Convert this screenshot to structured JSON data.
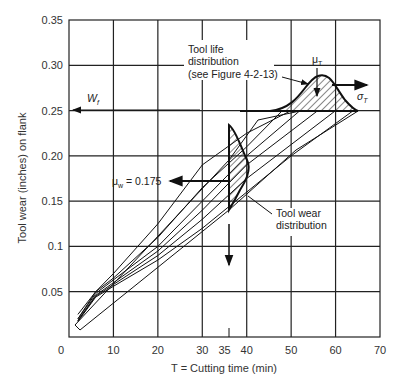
{
  "chart_data": {
    "type": "line",
    "title": "",
    "xlabel": "T = Cutting time (min)",
    "ylabel": "Tool wear (inches) on flank",
    "xlim": [
      0,
      70
    ],
    "ylim": [
      0,
      0.35
    ],
    "x_ticks": [
      "0",
      "10",
      "20",
      "30",
      "35",
      "40",
      "50",
      "60",
      "70"
    ],
    "x_tick_values": [
      0,
      10,
      20,
      30,
      35,
      40,
      50,
      60,
      70
    ],
    "y_ticks": [
      "0.05",
      "0.1",
      "0.15",
      "0.20",
      "0.25",
      "0.30",
      "0.35"
    ],
    "y_tick_values": [
      0.05,
      0.1,
      0.15,
      0.2,
      0.25,
      0.3,
      0.35
    ],
    "grid": true,
    "series": [
      {
        "name": "wear curve 1",
        "x": [
          2,
          6,
          10,
          20,
          30,
          40,
          50,
          60
        ],
        "y": [
          0.025,
          0.05,
          0.07,
          0.125,
          0.19,
          0.225,
          0.25,
          0.25
        ]
      },
      {
        "name": "wear curve 2",
        "x": [
          2,
          6,
          10,
          20,
          30,
          40,
          48
        ],
        "y": [
          0.02,
          0.05,
          0.065,
          0.11,
          0.165,
          0.21,
          0.25
        ]
      },
      {
        "name": "wear curve 3",
        "x": [
          2,
          6,
          10,
          20,
          30,
          40,
          52
        ],
        "y": [
          0.02,
          0.048,
          0.063,
          0.1,
          0.15,
          0.2,
          0.25
        ]
      },
      {
        "name": "wear curve 4",
        "x": [
          2,
          6,
          10,
          20,
          30,
          40,
          56
        ],
        "y": [
          0.018,
          0.046,
          0.06,
          0.095,
          0.14,
          0.19,
          0.25
        ]
      },
      {
        "name": "wear curve 5",
        "x": [
          2,
          6,
          10,
          20,
          30,
          40,
          60
        ],
        "y": [
          0.018,
          0.045,
          0.058,
          0.09,
          0.13,
          0.175,
          0.25
        ]
      },
      {
        "name": "wear curve 6",
        "x": [
          2,
          6,
          10,
          20,
          30,
          40,
          50,
          64
        ],
        "y": [
          0.017,
          0.044,
          0.056,
          0.085,
          0.12,
          0.16,
          0.2,
          0.25
        ]
      }
    ],
    "annotations": [
      {
        "text": "Tool life distribution (see Figure 4-2-13)",
        "x": 38,
        "y": 0.3
      },
      {
        "text": "μT",
        "x": 55,
        "y": 0.3
      },
      {
        "text": "σT",
        "x": 62,
        "y": 0.265
      },
      {
        "text": "Wf",
        "x": 5,
        "y": 0.255
      },
      {
        "text": "μw = 0.175",
        "x": 16,
        "y": 0.175
      },
      {
        "text": "Tool wear distribution",
        "x": 44,
        "y": 0.14
      }
    ],
    "failure_wear_level": 0.25,
    "mean_wear_at_35": 0.175,
    "mean_tool_life": 55
  },
  "labels": {
    "ann_tool_life_1": "Tool life",
    "ann_tool_life_2": "distribution",
    "ann_tool_life_3": "(see Figure 4-2-13)",
    "mu_t": "μ",
    "mu_t_sub": "T",
    "sigma_t": "σ",
    "sigma_t_sub": "T",
    "wf": "W",
    "wf_sub": "f",
    "mu_w": "μ",
    "mu_w_sub": "w",
    "mu_w_value": " = 0.175",
    "tool_wear_1": "Tool wear",
    "tool_wear_2": "distribution"
  }
}
